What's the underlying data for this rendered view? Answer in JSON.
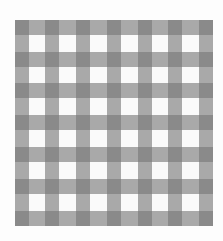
{
  "image": {
    "subject": "gingham-checkered-fabric",
    "colors": {
      "background": "#fdfdfd",
      "light_square": "#fafafa",
      "mid_square": "#a8a8a8",
      "dark_square": "#6e6e6e"
    },
    "pattern": {
      "columns_dark": 7,
      "rows_dark": 7
    }
  }
}
